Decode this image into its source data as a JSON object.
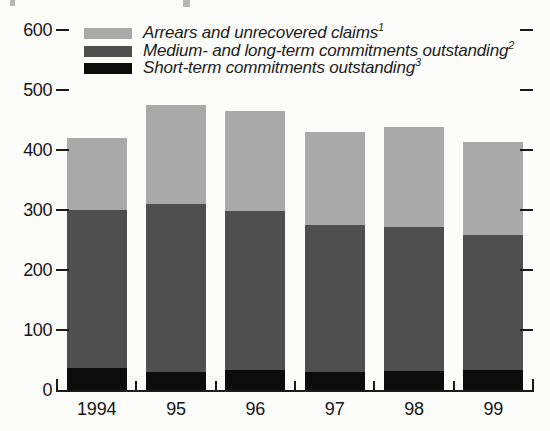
{
  "chart_data": {
    "type": "bar",
    "stacked": true,
    "title": "",
    "xlabel": "",
    "ylabel": "",
    "categories": [
      "1994",
      "95",
      "96",
      "97",
      "98",
      "99"
    ],
    "series": [
      {
        "name": "Arrears and unrecovered claims",
        "footnote": "1",
        "color": "#a9a9a9",
        "values": [
          120,
          165,
          167,
          155,
          167,
          156
        ]
      },
      {
        "name": "Medium- and long-term commitments outstanding",
        "footnote": "2",
        "color": "#4f4f4f",
        "values": [
          263,
          280,
          264,
          245,
          239,
          224
        ]
      },
      {
        "name": "Short-term commitments outstanding",
        "footnote": "3",
        "color": "#0c0c0c",
        "values": [
          37,
          30,
          34,
          30,
          32,
          34
        ]
      }
    ],
    "totals": [
      420,
      475,
      465,
      430,
      438,
      414
    ],
    "y_axis": {
      "min": 0,
      "max": 600,
      "ticks": [
        0,
        100,
        200,
        300,
        400,
        500,
        600
      ]
    },
    "legend_position": "top-left",
    "grid": false,
    "axis_color": "#1b1b1b",
    "text_color": "#161616",
    "background": "#fcfcfb"
  }
}
